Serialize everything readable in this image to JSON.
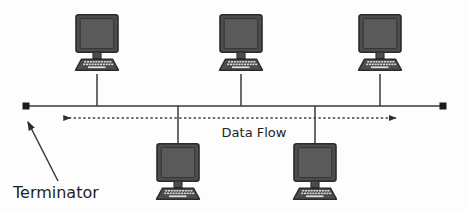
{
  "diagram": {
    "type": "network-topology-bus",
    "canvas": {
      "width": 468,
      "height": 211
    },
    "background_color": "#fdfdfd",
    "colors": {
      "line": "#3a3a3a",
      "bezel": "#4a4a4a",
      "bezel_outline": "#2b2b2b",
      "screen": "#555555",
      "keyboard": "#4a4a4a",
      "key": "#d8d8d8",
      "terminator": "#1b1b1b",
      "text": "#1f1f1f",
      "dashed": "#3f3f3f"
    },
    "labels": {
      "data_flow": "Data Flow",
      "terminator": "Terminator"
    },
    "backbone": {
      "name": "bus-backbone-line",
      "x1": 26,
      "x2": 443,
      "y": 106
    },
    "terminators": [
      {
        "name": "terminator-left",
        "x": 26,
        "y": 106,
        "size": 7
      },
      {
        "name": "terminator-right",
        "x": 443,
        "y": 106,
        "size": 7
      }
    ],
    "data_flow_arrow": {
      "name": "data-flow-dashed-arrow",
      "x1": 64,
      "x2": 396,
      "y": 118,
      "direction": "bidirectional",
      "style": "dashed"
    },
    "terminator_pointer": {
      "name": "terminator-callout-arrow",
      "from_x": 58,
      "from_y": 181,
      "to_x": 27,
      "to_y": 121
    },
    "label_positions": {
      "data_flow": {
        "x": 254,
        "y": 137,
        "anchor": "middle"
      },
      "terminator": {
        "x": 13,
        "y": 198,
        "anchor": "start"
      }
    },
    "nodes": [
      {
        "name": "computer-top-1",
        "label": "",
        "position": "top",
        "cx": 97,
        "drop_y_from": 76,
        "drop_y_to": 106,
        "icon_x": 73,
        "icon_y": 14
      },
      {
        "name": "computer-top-2",
        "label": "",
        "position": "top",
        "cx": 241,
        "drop_y_from": 76,
        "drop_y_to": 106,
        "icon_x": 217,
        "icon_y": 14
      },
      {
        "name": "computer-top-3",
        "label": "",
        "position": "top",
        "cx": 380,
        "drop_y_from": 76,
        "drop_y_to": 106,
        "icon_x": 356,
        "icon_y": 14
      },
      {
        "name": "computer-bottom-1",
        "label": "",
        "position": "bottom",
        "cx": 178,
        "drop_y_from": 106,
        "drop_y_to": 145,
        "icon_x": 154,
        "icon_y": 143
      },
      {
        "name": "computer-bottom-2",
        "label": "",
        "position": "bottom",
        "cx": 315,
        "drop_y_from": 106,
        "drop_y_to": 145,
        "icon_x": 291,
        "icon_y": 143
      }
    ],
    "icon_geometry": {
      "name": "computer-icon",
      "width": 48,
      "height": 62,
      "monitor": {
        "x": 3,
        "y": 0,
        "w": 42,
        "h": 38,
        "r": 2
      },
      "screen": {
        "x": 7,
        "y": 4,
        "w": 34,
        "h": 30
      },
      "neck": {
        "x": 20,
        "y": 38,
        "w": 8,
        "h": 7
      },
      "keyboard_top_w": 34,
      "keyboard_bottom_w": 46,
      "keyboard_y": 45,
      "keyboard_h": 11,
      "key_rows": 3,
      "key_cols": 11
    }
  }
}
